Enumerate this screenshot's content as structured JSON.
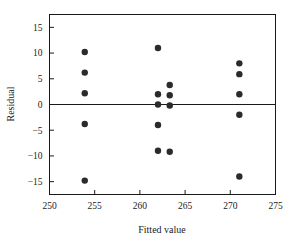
{
  "chart_data": {
    "type": "scatter",
    "title": "",
    "xlabel": "Fitted value",
    "ylabel": "Residual",
    "xlim": [
      250,
      275
    ],
    "ylim": [
      -17.5,
      17.5
    ],
    "xticks": [
      250,
      255,
      260,
      265,
      270,
      275
    ],
    "yticks": [
      15,
      10,
      5,
      0,
      -5,
      -10,
      -15
    ],
    "xtick_labels": [
      "250",
      "255",
      "260",
      "265",
      "270",
      "275"
    ],
    "ytick_labels": [
      "15",
      "10",
      "5",
      "0",
      "−5",
      "−10",
      "−15"
    ],
    "grid": false,
    "legend": null,
    "reference_lines": [
      {
        "name": "zero-residual-line",
        "orientation": "horizontal",
        "y": 0
      }
    ],
    "marker": {
      "shape": "circle",
      "color": "#2b2b2b",
      "size_px": 3.2
    },
    "series": [
      {
        "name": "residuals",
        "points": [
          {
            "x": 253.9,
            "y": 10.2
          },
          {
            "x": 253.9,
            "y": 6.2
          },
          {
            "x": 253.9,
            "y": 2.2
          },
          {
            "x": 253.9,
            "y": -3.8
          },
          {
            "x": 253.9,
            "y": -14.8
          },
          {
            "x": 262.0,
            "y": 11.0
          },
          {
            "x": 262.0,
            "y": 2.0
          },
          {
            "x": 262.0,
            "y": 0.0
          },
          {
            "x": 262.0,
            "y": -4.0
          },
          {
            "x": 262.0,
            "y": -9.0
          },
          {
            "x": 263.3,
            "y": 3.8
          },
          {
            "x": 263.3,
            "y": 1.8
          },
          {
            "x": 263.3,
            "y": -0.2
          },
          {
            "x": 263.3,
            "y": -9.2
          },
          {
            "x": 271.0,
            "y": 8.0
          },
          {
            "x": 271.0,
            "y": 5.9
          },
          {
            "x": 271.0,
            "y": 2.0
          },
          {
            "x": 271.0,
            "y": -2.0
          },
          {
            "x": 271.0,
            "y": -14.0
          }
        ]
      }
    ]
  }
}
